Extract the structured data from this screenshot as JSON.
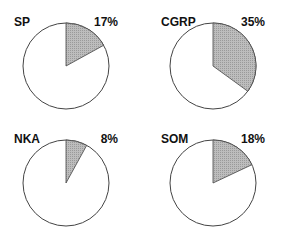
{
  "chart_data": [
    {
      "type": "pie",
      "title": "SP",
      "label": "17%",
      "values": [
        17,
        83
      ],
      "categories": [
        "shaded",
        "unshaded"
      ]
    },
    {
      "type": "pie",
      "title": "CGRP",
      "label": "35%",
      "values": [
        35,
        65
      ],
      "categories": [
        "shaded",
        "unshaded"
      ]
    },
    {
      "type": "pie",
      "title": "NKA",
      "label": "8%",
      "values": [
        8,
        92
      ],
      "categories": [
        "shaded",
        "unshaded"
      ]
    },
    {
      "type": "pie",
      "title": "SOM",
      "label": "18%",
      "values": [
        18,
        82
      ],
      "categories": [
        "shaded",
        "unshaded"
      ]
    }
  ],
  "colors": {
    "shaded": "#b8b8b8",
    "unshaded": "#ffffff",
    "stroke": "#444444"
  }
}
